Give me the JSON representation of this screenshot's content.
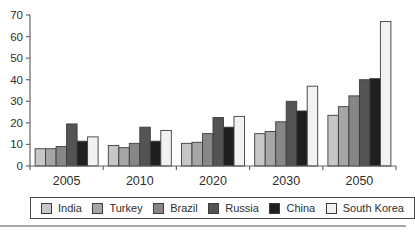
{
  "chart_data": {
    "type": "bar",
    "title": "",
    "xlabel": "",
    "ylabel": "",
    "categories": [
      "2005",
      "2010",
      "2020",
      "2030",
      "2050"
    ],
    "series": [
      {
        "name": "India",
        "color": "#c7c7c7",
        "values": [
          8,
          9.5,
          10.5,
          15,
          23.5
        ]
      },
      {
        "name": "Turkey",
        "color": "#a6a6a6",
        "values": [
          8,
          8.5,
          11,
          16,
          27.5
        ]
      },
      {
        "name": "Brazil",
        "color": "#878787",
        "values": [
          9,
          10.5,
          15,
          20.5,
          32.5
        ]
      },
      {
        "name": "Russia",
        "color": "#545454",
        "values": [
          19.5,
          18,
          22.5,
          30,
          40
        ]
      },
      {
        "name": "China",
        "color": "#1f1f1f",
        "values": [
          11.5,
          11.5,
          18,
          25.5,
          40.5
        ]
      },
      {
        "name": "South Korea",
        "color": "#f2f2f2",
        "values": [
          13.5,
          16.5,
          23,
          37,
          67
        ]
      }
    ],
    "ylim": [
      0,
      70
    ],
    "y_ticks": [
      0,
      10,
      20,
      30,
      40,
      50,
      60,
      70
    ],
    "grid": false,
    "legend_position": "bottom"
  },
  "style": {
    "axis_color": "#666666",
    "tick_label_color": "#2e2e2e",
    "category_label_color": "#2e2e2e",
    "bar_stroke_color": "#3d3d3d",
    "legend_border_color": "#4a4a4a",
    "bottom_rule_color": "#a9a9a9",
    "background": "#ffffff"
  }
}
